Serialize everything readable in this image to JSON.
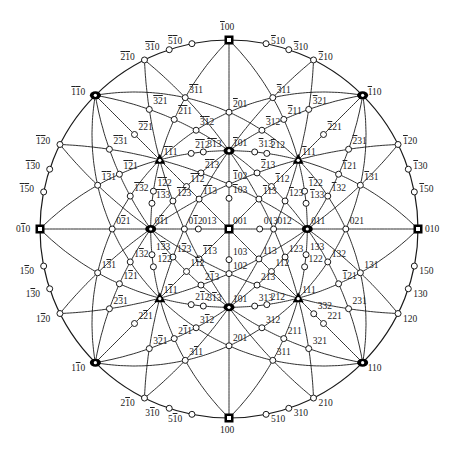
{
  "diagram": {
    "title": "",
    "type": "stereographic-projection",
    "projection_pole": "001",
    "colors": {
      "line": "#1a1a1a",
      "background": "#ffffff",
      "pole_fill": "#ffffff",
      "major_pole": "#000000"
    },
    "geometry": {
      "cx": 229,
      "cy": 229,
      "radius": 189
    },
    "orientation": {
      "top": "-100",
      "bottom": "100",
      "left": "0-10",
      "right": "010"
    },
    "zone_circles": [
      [
        1,
        0,
        0
      ],
      [
        0,
        1,
        0
      ],
      [
        1,
        1,
        0
      ],
      [
        1,
        -1,
        0
      ],
      [
        1,
        0,
        1
      ],
      [
        1,
        0,
        -1
      ],
      [
        0,
        1,
        1
      ],
      [
        0,
        1,
        -1
      ],
      [
        1,
        1,
        1
      ],
      [
        1,
        1,
        -1
      ],
      [
        1,
        -1,
        1
      ],
      [
        -1,
        1,
        1
      ],
      [
        1,
        1,
        2
      ],
      [
        1,
        1,
        -2
      ],
      [
        1,
        -1,
        2
      ],
      [
        -1,
        1,
        2
      ],
      [
        2,
        1,
        1
      ],
      [
        2,
        -1,
        1
      ],
      [
        2,
        1,
        -1
      ],
      [
        2,
        -1,
        -1
      ],
      [
        1,
        2,
        1
      ],
      [
        -1,
        2,
        1
      ],
      [
        1,
        2,
        -1
      ],
      [
        -1,
        2,
        -1
      ],
      [
        0,
        0,
        1
      ]
    ],
    "poles": [
      {
        "hkl": [
          0,
          0,
          1
        ],
        "label": "001",
        "type": "square"
      },
      {
        "hkl": [
          1,
          0,
          0
        ],
        "label": "100",
        "type": "square"
      },
      {
        "hkl": [
          -1,
          0,
          0
        ],
        "label": "-100",
        "type": "square"
      },
      {
        "hkl": [
          0,
          1,
          0
        ],
        "label": "010",
        "type": "square"
      },
      {
        "hkl": [
          0,
          -1,
          0
        ],
        "label": "0-10",
        "type": "square"
      },
      {
        "hkl": [
          1,
          0,
          1
        ],
        "label": "101",
        "type": "oval"
      },
      {
        "hkl": [
          -1,
          0,
          1
        ],
        "label": "-101",
        "type": "oval"
      },
      {
        "hkl": [
          0,
          1,
          1
        ],
        "label": "011",
        "type": "oval"
      },
      {
        "hkl": [
          0,
          -1,
          1
        ],
        "label": "0-11",
        "type": "oval"
      },
      {
        "hkl": [
          1,
          1,
          0
        ],
        "label": "110",
        "type": "oval"
      },
      {
        "hkl": [
          -1,
          -1,
          0
        ],
        "label": "-1-10",
        "type": "oval"
      },
      {
        "hkl": [
          1,
          -1,
          0
        ],
        "label": "1-10",
        "type": "oval"
      },
      {
        "hkl": [
          -1,
          1,
          0
        ],
        "label": "-110",
        "type": "oval"
      },
      {
        "hkl": [
          1,
          1,
          1
        ],
        "label": "111",
        "type": "triangle"
      },
      {
        "hkl": [
          1,
          -1,
          1
        ],
        "label": "1-11",
        "type": "triangle"
      },
      {
        "hkl": [
          -1,
          1,
          1
        ],
        "label": "-111",
        "type": "triangle"
      },
      {
        "hkl": [
          -1,
          -1,
          1
        ],
        "label": "-1-11",
        "type": "triangle"
      },
      {
        "hkl": [
          1,
          0,
          2
        ],
        "label": "102"
      },
      {
        "hkl": [
          -1,
          0,
          2
        ],
        "label": "-102"
      },
      {
        "hkl": [
          0,
          1,
          2
        ],
        "label": "012"
      },
      {
        "hkl": [
          0,
          -1,
          2
        ],
        "label": "0-12"
      },
      {
        "hkl": [
          1,
          0,
          3
        ],
        "label": "103"
      },
      {
        "hkl": [
          -1,
          0,
          3
        ],
        "label": "-103"
      },
      {
        "hkl": [
          0,
          1,
          3
        ],
        "label": "013"
      },
      {
        "hkl": [
          0,
          -1,
          3
        ],
        "label": "013"
      },
      {
        "hkl": [
          2,
          0,
          1
        ],
        "label": "201"
      },
      {
        "hkl": [
          -2,
          0,
          1
        ],
        "label": "-201"
      },
      {
        "hkl": [
          0,
          2,
          1
        ],
        "label": "021"
      },
      {
        "hkl": [
          0,
          -2,
          1
        ],
        "label": "0-21"
      },
      {
        "hkl": [
          1,
          1,
          2
        ],
        "label": "112"
      },
      {
        "hkl": [
          1,
          -1,
          2
        ],
        "label": "1-12"
      },
      {
        "hkl": [
          -1,
          1,
          2
        ],
        "label": "-112"
      },
      {
        "hkl": [
          -1,
          -1,
          2
        ],
        "label": "-1-12"
      },
      {
        "hkl": [
          1,
          1,
          3
        ],
        "label": "113"
      },
      {
        "hkl": [
          1,
          -1,
          3
        ],
        "label": "-1-13"
      },
      {
        "hkl": [
          -1,
          1,
          3
        ],
        "label": "-113"
      },
      {
        "hkl": [
          -1,
          -1,
          3
        ],
        "label": "-1-13"
      },
      {
        "hkl": [
          2,
          1,
          1
        ],
        "label": "211"
      },
      {
        "hkl": [
          2,
          -1,
          1
        ],
        "label": "2-11"
      },
      {
        "hkl": [
          -2,
          1,
          1
        ],
        "label": "-211"
      },
      {
        "hkl": [
          -2,
          -1,
          1
        ],
        "label": "-2-11"
      },
      {
        "hkl": [
          1,
          2,
          1
        ],
        "label": "-121"
      },
      {
        "hkl": [
          1,
          -2,
          1
        ],
        "label": "1-21"
      },
      {
        "hkl": [
          -1,
          2,
          1
        ],
        "label": "-121"
      },
      {
        "hkl": [
          -1,
          -2,
          1
        ],
        "label": "-1-21"
      },
      {
        "hkl": [
          2,
          2,
          1
        ],
        "label": "221"
      },
      {
        "hkl": [
          2,
          -2,
          1
        ],
        "label": "2-21"
      },
      {
        "hkl": [
          -2,
          2,
          1
        ],
        "label": "-221"
      },
      {
        "hkl": [
          -2,
          -2,
          1
        ],
        "label": "-2-21"
      },
      {
        "hkl": [
          1,
          2,
          2
        ],
        "label": "122"
      },
      {
        "hkl": [
          1,
          -2,
          2
        ],
        "label": "1-22"
      },
      {
        "hkl": [
          -1,
          2,
          2
        ],
        "label": "-122"
      },
      {
        "hkl": [
          -1,
          -2,
          2
        ],
        "label": "-1-22"
      },
      {
        "hkl": [
          2,
          1,
          2
        ],
        "label": "212"
      },
      {
        "hkl": [
          2,
          -1,
          2
        ],
        "label": "2-12"
      },
      {
        "hkl": [
          -2,
          1,
          2
        ],
        "label": "-212"
      },
      {
        "hkl": [
          -2,
          -1,
          2
        ],
        "label": "-2-12"
      },
      {
        "hkl": [
          1,
          2,
          3
        ],
        "label": "123"
      },
      {
        "hkl": [
          1,
          -2,
          3
        ],
        "label": "1-23"
      },
      {
        "hkl": [
          -1,
          2,
          3
        ],
        "label": "-123"
      },
      {
        "hkl": [
          -1,
          -2,
          3
        ],
        "label": "-1-23"
      },
      {
        "hkl": [
          2,
          1,
          3
        ],
        "label": "213"
      },
      {
        "hkl": [
          2,
          -1,
          3
        ],
        "label": "2-13"
      },
      {
        "hkl": [
          -2,
          1,
          3
        ],
        "label": "-213"
      },
      {
        "hkl": [
          -2,
          -1,
          3
        ],
        "label": "-2-13"
      },
      {
        "hkl": [
          3,
          1,
          3
        ],
        "label": "313"
      },
      {
        "hkl": [
          3,
          -1,
          3
        ],
        "label": "3-13"
      },
      {
        "hkl": [
          -3,
          1,
          3
        ],
        "label": "-313"
      },
      {
        "hkl": [
          -3,
          -1,
          3
        ],
        "label": "-3-13"
      },
      {
        "hkl": [
          1,
          3,
          3
        ],
        "label": "133"
      },
      {
        "hkl": [
          1,
          -3,
          3
        ],
        "label": "1-33"
      },
      {
        "hkl": [
          -1,
          3,
          3
        ],
        "label": "-133"
      },
      {
        "hkl": [
          -1,
          -3,
          3
        ],
        "label": "-1-33"
      },
      {
        "hkl": [
          1,
          3,
          2
        ],
        "label": "132"
      },
      {
        "hkl": [
          1,
          -3,
          2
        ],
        "label": "1-32"
      },
      {
        "hkl": [
          -1,
          3,
          2
        ],
        "label": "-132"
      },
      {
        "hkl": [
          -1,
          -3,
          2
        ],
        "label": "-1-32"
      },
      {
        "hkl": [
          3,
          1,
          2
        ],
        "label": "312"
      },
      {
        "hkl": [
          3,
          -1,
          2
        ],
        "label": "3-12"
      },
      {
        "hkl": [
          -3,
          1,
          2
        ],
        "label": "-312"
      },
      {
        "hkl": [
          -3,
          -1,
          2
        ],
        "label": "-3-12"
      },
      {
        "hkl": [
          3,
          1,
          1
        ],
        "label": "311"
      },
      {
        "hkl": [
          3,
          -1,
          1
        ],
        "label": "3-11"
      },
      {
        "hkl": [
          -3,
          1,
          1
        ],
        "label": "-311"
      },
      {
        "hkl": [
          -3,
          -1,
          1
        ],
        "label": "-3-11"
      },
      {
        "hkl": [
          3,
          2,
          1
        ],
        "label": "321"
      },
      {
        "hkl": [
          3,
          -2,
          1
        ],
        "label": "3-21"
      },
      {
        "hkl": [
          -3,
          2,
          1
        ],
        "label": "-321"
      },
      {
        "hkl": [
          -3,
          -2,
          1
        ],
        "label": "-3-21"
      },
      {
        "hkl": [
          2,
          3,
          1
        ],
        "label": "231"
      },
      {
        "hkl": [
          2,
          -3,
          1
        ],
        "label": "2-31"
      },
      {
        "hkl": [
          -2,
          3,
          1
        ],
        "label": "-231"
      },
      {
        "hkl": [
          -2,
          -3,
          1
        ],
        "label": "-2-31"
      },
      {
        "hkl": [
          1,
          3,
          1
        ],
        "label": "131"
      },
      {
        "hkl": [
          1,
          -3,
          1
        ],
        "label": "1-31"
      },
      {
        "hkl": [
          -1,
          3,
          1
        ],
        "label": "-131"
      },
      {
        "hkl": [
          -1,
          -3,
          1
        ],
        "label": "-1-31"
      },
      {
        "hkl": [
          3,
          3,
          2
        ],
        "label": "332"
      },
      {
        "hkl": [
          2,
          1,
          0
        ],
        "label": "210"
      },
      {
        "hkl": [
          3,
          1,
          0
        ],
        "label": "310"
      },
      {
        "hkl": [
          5,
          1,
          0
        ],
        "label": "510"
      },
      {
        "hkl": [
          2,
          -1,
          0
        ],
        "label": "2-10"
      },
      {
        "hkl": [
          3,
          -1,
          0
        ],
        "label": "3-10"
      },
      {
        "hkl": [
          5,
          -1,
          0
        ],
        "label": "5-10"
      },
      {
        "hkl": [
          -2,
          1,
          0
        ],
        "label": "-210"
      },
      {
        "hkl": [
          -3,
          1,
          0
        ],
        "label": "-310"
      },
      {
        "hkl": [
          -5,
          1,
          0
        ],
        "label": "-510"
      },
      {
        "hkl": [
          -2,
          -1,
          0
        ],
        "label": "-2-10"
      },
      {
        "hkl": [
          -3,
          -1,
          0
        ],
        "label": "-3-10"
      },
      {
        "hkl": [
          -5,
          -1,
          0
        ],
        "label": "-5-10"
      },
      {
        "hkl": [
          1,
          2,
          0
        ],
        "label": "120"
      },
      {
        "hkl": [
          1,
          3,
          0
        ],
        "label": "130"
      },
      {
        "hkl": [
          1,
          5,
          0
        ],
        "label": "150"
      },
      {
        "hkl": [
          -1,
          2,
          0
        ],
        "label": "-120"
      },
      {
        "hkl": [
          -1,
          3,
          0
        ],
        "label": "-130"
      },
      {
        "hkl": [
          -1,
          5,
          0
        ],
        "label": "-150"
      },
      {
        "hkl": [
          1,
          -2,
          0
        ],
        "label": "1-20"
      },
      {
        "hkl": [
          1,
          -3,
          0
        ],
        "label": "1-30"
      },
      {
        "hkl": [
          1,
          -5,
          0
        ],
        "label": "1-50"
      },
      {
        "hkl": [
          -1,
          -2,
          0
        ],
        "label": "-1-20"
      },
      {
        "hkl": [
          -1,
          -3,
          0
        ],
        "label": "-1-30"
      },
      {
        "hkl": [
          -1,
          -5,
          0
        ],
        "label": "-1-50"
      }
    ]
  }
}
